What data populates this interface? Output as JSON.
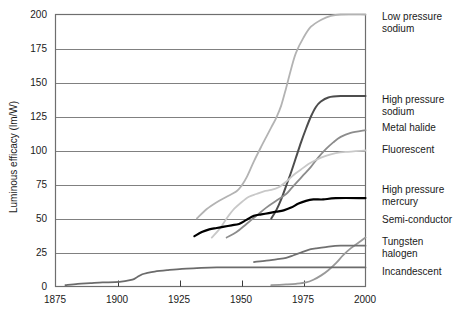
{
  "chart_data": {
    "type": "line",
    "title": "",
    "xlabel": "",
    "ylabel": "Luminous efficacy (lm/W)",
    "xlim": [
      1875,
      2000
    ],
    "ylim": [
      0,
      200
    ],
    "xticks": [
      1875,
      1900,
      1925,
      1950,
      1975,
      2000
    ],
    "yticks": [
      0,
      25,
      50,
      75,
      100,
      125,
      150,
      175,
      200
    ],
    "grid": true,
    "legend_position": "right-of-axes-inline",
    "series": [
      {
        "name": "Low pressure sodium",
        "color": "#b3b3b3",
        "width": 1.8,
        "label_x": 382,
        "label_y": 20,
        "points": [
          [
            1932,
            50
          ],
          [
            1936,
            57
          ],
          [
            1940,
            62
          ],
          [
            1944,
            66
          ],
          [
            1948,
            70
          ],
          [
            1950,
            74
          ],
          [
            1952,
            80
          ],
          [
            1955,
            92
          ],
          [
            1958,
            103
          ],
          [
            1960,
            110
          ],
          [
            1962,
            117
          ],
          [
            1964,
            124
          ],
          [
            1966,
            133
          ],
          [
            1968,
            146
          ],
          [
            1970,
            160
          ],
          [
            1972,
            172
          ],
          [
            1975,
            183
          ],
          [
            1978,
            191
          ],
          [
            1982,
            196
          ],
          [
            1986,
            199
          ],
          [
            1990,
            200
          ],
          [
            2000,
            200
          ]
        ]
      },
      {
        "name": "High pressure sodium",
        "color": "#4d4d4d",
        "width": 2.0,
        "label_x": 382,
        "label_y": 103,
        "points": [
          [
            1962,
            50
          ],
          [
            1964,
            56
          ],
          [
            1966,
            64
          ],
          [
            1968,
            74
          ],
          [
            1970,
            84
          ],
          [
            1972,
            95
          ],
          [
            1974,
            106
          ],
          [
            1976,
            116
          ],
          [
            1978,
            125
          ],
          [
            1980,
            132
          ],
          [
            1982,
            136
          ],
          [
            1985,
            139
          ],
          [
            1990,
            140
          ],
          [
            2000,
            140
          ]
        ]
      },
      {
        "name": "Metal halide",
        "color": "#8c8c8c",
        "width": 1.8,
        "label_x": 382,
        "label_y": 130,
        "points": [
          [
            1944,
            36
          ],
          [
            1948,
            40
          ],
          [
            1952,
            46
          ],
          [
            1956,
            52
          ],
          [
            1960,
            58
          ],
          [
            1964,
            63
          ],
          [
            1968,
            68
          ],
          [
            1970,
            72
          ],
          [
            1972,
            76
          ],
          [
            1975,
            82
          ],
          [
            1978,
            88
          ],
          [
            1981,
            95
          ],
          [
            1984,
            101
          ],
          [
            1987,
            106
          ],
          [
            1990,
            110
          ],
          [
            1994,
            113
          ],
          [
            2000,
            115
          ]
        ]
      },
      {
        "name": "Fluorescent",
        "color": "#c8c8c8",
        "width": 1.8,
        "label_x": 382,
        "label_y": 152,
        "points": [
          [
            1938,
            36
          ],
          [
            1941,
            42
          ],
          [
            1944,
            50
          ],
          [
            1947,
            57
          ],
          [
            1950,
            62
          ],
          [
            1953,
            66
          ],
          [
            1956,
            68
          ],
          [
            1959,
            70
          ],
          [
            1962,
            71
          ],
          [
            1965,
            73
          ],
          [
            1968,
            77
          ],
          [
            1971,
            82
          ],
          [
            1974,
            86
          ],
          [
            1977,
            90
          ],
          [
            1980,
            93
          ],
          [
            1984,
            96
          ],
          [
            1988,
            98
          ],
          [
            1992,
            99
          ],
          [
            2000,
            100
          ]
        ]
      },
      {
        "name": "High pressure mercury",
        "color": "#000000",
        "width": 2.2,
        "label_x": 382,
        "label_y": 192,
        "points": [
          [
            1931,
            37
          ],
          [
            1934,
            40
          ],
          [
            1937,
            42
          ],
          [
            1940,
            43
          ],
          [
            1943,
            44
          ],
          [
            1946,
            45
          ],
          [
            1949,
            46
          ],
          [
            1952,
            49
          ],
          [
            1955,
            52
          ],
          [
            1958,
            53
          ],
          [
            1961,
            54
          ],
          [
            1964,
            55
          ],
          [
            1967,
            56
          ],
          [
            1970,
            58
          ],
          [
            1973,
            61
          ],
          [
            1976,
            63
          ],
          [
            1979,
            64
          ],
          [
            1983,
            64
          ],
          [
            1988,
            65
          ],
          [
            2000,
            65
          ]
        ]
      },
      {
        "name": "Semi-conductor",
        "color": "#999999",
        "width": 1.8,
        "label_x": 382,
        "label_y": 222,
        "points": [
          [
            1962,
            1
          ],
          [
            1968,
            1.5
          ],
          [
            1972,
            2
          ],
          [
            1976,
            3
          ],
          [
            1979,
            5
          ],
          [
            1982,
            8
          ],
          [
            1985,
            12
          ],
          [
            1988,
            17
          ],
          [
            1991,
            23
          ],
          [
            1994,
            28
          ],
          [
            1997,
            32
          ],
          [
            2000,
            36
          ]
        ]
      },
      {
        "name": "Tungsten halogen",
        "color": "#707070",
        "width": 1.8,
        "label_x": 382,
        "label_y": 244,
        "points": [
          [
            1955,
            18
          ],
          [
            1960,
            19
          ],
          [
            1964,
            20
          ],
          [
            1968,
            21
          ],
          [
            1971,
            23
          ],
          [
            1974,
            25
          ],
          [
            1977,
            27
          ],
          [
            1980,
            28
          ],
          [
            1984,
            29
          ],
          [
            1990,
            30
          ],
          [
            2000,
            30
          ]
        ]
      },
      {
        "name": "Incandescent",
        "color": "#6b6b6b",
        "width": 1.8,
        "label_x": 382,
        "label_y": 274,
        "points": [
          [
            1879,
            1
          ],
          [
            1884,
            2
          ],
          [
            1889,
            2.5
          ],
          [
            1894,
            3
          ],
          [
            1899,
            3.2
          ],
          [
            1903,
            4
          ],
          [
            1906,
            5
          ],
          [
            1908,
            7
          ],
          [
            1910,
            9
          ],
          [
            1912,
            10
          ],
          [
            1915,
            11
          ],
          [
            1920,
            12
          ],
          [
            1926,
            13
          ],
          [
            1932,
            13.5
          ],
          [
            1940,
            14
          ],
          [
            1955,
            14
          ],
          [
            1975,
            14
          ],
          [
            2000,
            14
          ]
        ]
      }
    ]
  },
  "axes": {
    "y_axis_title": "Luminous efficacy (lm/W)",
    "y_tick_labels": [
      "200",
      "175",
      "150",
      "125",
      "100",
      "75",
      "50",
      "25",
      "0"
    ],
    "x_tick_labels": [
      "1875",
      "1900",
      "1925",
      "1950",
      "1975",
      "2000"
    ]
  },
  "labels": {
    "low_pressure_sodium_line1": "Low pressure",
    "low_pressure_sodium_line2": "sodium",
    "high_pressure_sodium_line1": "High pressure",
    "high_pressure_sodium_line2": "sodium",
    "metal_halide": "Metal halide",
    "fluorescent": "Fluorescent",
    "high_pressure_mercury_line1": "High pressure",
    "high_pressure_mercury_line2": "mercury",
    "semi_conductor": "Semi-conductor",
    "tungsten_halogen_line1": "Tungsten",
    "tungsten_halogen_line2": "halogen",
    "incandescent": "Incandescent"
  }
}
